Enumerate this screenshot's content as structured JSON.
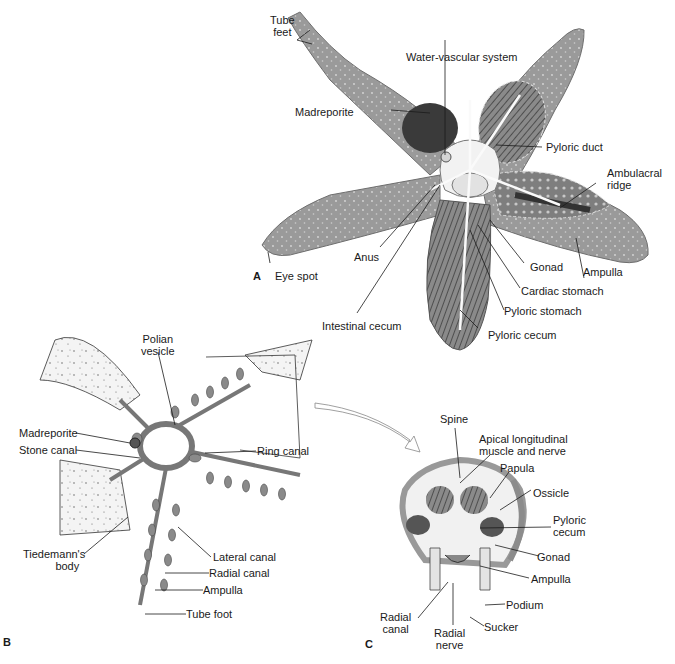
{
  "figure": {
    "panels": [
      {
        "id": "A",
        "description": "Dorsal view of sea star with arms dissected showing internal organs",
        "labels": [
          "Tube feet",
          "Water-vascular system",
          "Madreporite",
          "Pyloric duct",
          "Ambulacral ridge",
          "Gonad",
          "Ampulla",
          "Cardiac stomach",
          "Pyloric stomach",
          "Pyloric cecum",
          "Intestinal cecum",
          "Anus",
          "Eye spot"
        ]
      },
      {
        "id": "B",
        "description": "Water-vascular system",
        "labels": [
          "Polian vesicle",
          "Madreporite",
          "Stone canal",
          "Ring canal",
          "Tiedemann's body",
          "Lateral canal",
          "Radial canal",
          "Ampulla",
          "Tube foot"
        ]
      },
      {
        "id": "C",
        "description": "Cross section of arm",
        "labels": [
          "Spine",
          "Apical longitudinal muscle and nerve",
          "Papula",
          "Ossicle",
          "Pyloric cecum",
          "Gonad",
          "Ampulla",
          "Podium",
          "Sucker",
          "Radial canal",
          "Radial nerve"
        ]
      }
    ]
  },
  "panelA": {
    "letter": "A",
    "tube_feet_1": "Tube",
    "tube_feet_2": "feet",
    "water_vascular": "Water-vascular system",
    "madreporite": "Madreporite",
    "pyloric_duct": "Pyloric duct",
    "ambulacral_1": "Ambulacral",
    "ambulacral_2": "ridge",
    "gonad": "Gonad",
    "ampulla": "Ampulla",
    "cardiac_stomach": "Cardiac stomach",
    "pyloric_stomach": "Pyloric stomach",
    "pyloric_cecum": "Pyloric cecum",
    "intestinal_cecum": "Intestinal cecum",
    "anus": "Anus",
    "eye_spot": "Eye spot"
  },
  "panelB": {
    "letter": "B",
    "polian_1": "Polian",
    "polian_2": "vesicle",
    "madreporite": "Madreporite",
    "stone_canal": "Stone canal",
    "ring_canal": "Ring canal",
    "tiedemann_1": "Tiedemann's",
    "tiedemann_2": "body",
    "lateral_canal": "Lateral canal",
    "radial_canal": "Radial canal",
    "ampulla": "Ampulla",
    "tube_foot": "Tube foot"
  },
  "panelC": {
    "letter": "C",
    "spine": "Spine",
    "apical_1": "Apical longitudinal",
    "apical_2": "muscle and nerve",
    "papula": "Papula",
    "ossicle": "Ossicle",
    "pyloric_1": "Pyloric",
    "pyloric_2": "cecum",
    "gonad": "Gonad",
    "ampulla": "Ampulla",
    "podium": "Podium",
    "sucker": "Sucker",
    "radial_canal_1": "Radial",
    "radial_canal_2": "canal",
    "radial_nerve_1": "Radial",
    "radial_nerve_2": "nerve"
  },
  "colors": {
    "skin": "#9a9a9a",
    "skin_dark": "#6e6e6e",
    "organ_dark": "#3a3a3a",
    "light": "#e6e6e6",
    "line": "#1a1a1a"
  }
}
